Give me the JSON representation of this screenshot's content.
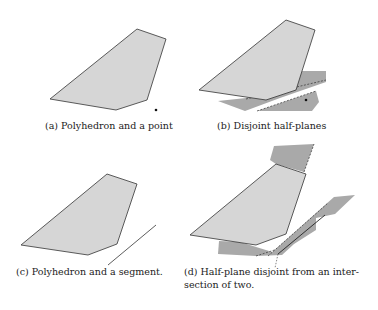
{
  "colors": {
    "polygon_fill": "#d6d6d6",
    "halfplane_fill": "#a9a9a9",
    "stroke": "#333333"
  },
  "panels": [
    {
      "id": "a",
      "caption": "(a) Polyhedron and a point"
    },
    {
      "id": "b",
      "caption": "(b) Disjoint half-planes"
    },
    {
      "id": "c",
      "caption": "(c) Polyhedron and a segment."
    },
    {
      "id": "d",
      "caption_line1": "(d) Half-plane disjoint from an inter-",
      "caption_line2": "section of two."
    }
  ]
}
